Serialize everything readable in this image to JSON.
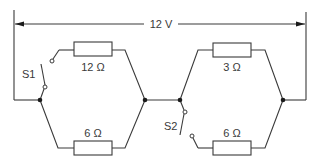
{
  "diagram": {
    "type": "circuit",
    "supply": {
      "label": "12 V"
    },
    "switches": [
      {
        "id": "S1",
        "label": "S1",
        "state": "open"
      },
      {
        "id": "S2",
        "label": "S2",
        "state": "open"
      }
    ],
    "resistors": [
      {
        "id": "R1",
        "label": "12 Ω",
        "group": "left",
        "branch": "top",
        "switch": "S1"
      },
      {
        "id": "R2",
        "label": "6 Ω",
        "group": "left",
        "branch": "bottom"
      },
      {
        "id": "R3",
        "label": "3 Ω",
        "group": "right",
        "branch": "top"
      },
      {
        "id": "R4",
        "label": "6 Ω",
        "group": "right",
        "branch": "bottom",
        "switch": "S2"
      }
    ]
  }
}
